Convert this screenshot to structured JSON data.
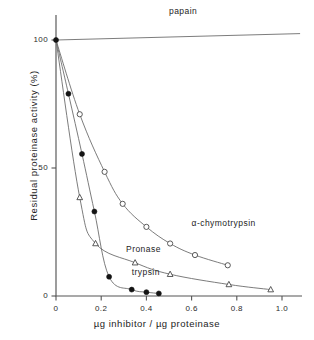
{
  "chart_data": {
    "type": "line",
    "title": "",
    "xlabel": "µg inhibitor / µg proteinase",
    "ylabel": "Residual  proteinase  activity  (%)",
    "xlim": [
      0,
      1.08
    ],
    "ylim": [
      0,
      108
    ],
    "xticks": [
      0,
      0.2,
      0.4,
      0.6,
      0.8,
      1.0
    ],
    "xticklabels": [
      "0",
      "0.2",
      "0.4",
      "0.6",
      "0.8",
      "1.0"
    ],
    "yticks": [
      0,
      50,
      100
    ],
    "yticklabels": [
      "0",
      "50",
      "100"
    ],
    "grid": false,
    "legend_position": "inline-annotations",
    "series": [
      {
        "name": "papain",
        "marker": "none",
        "label_x": 0.5,
        "label_y": 111,
        "x": [
          0.0,
          1.08
        ],
        "y": [
          100,
          102.5
        ]
      },
      {
        "name": "α-chymotrypsin",
        "marker": "open-circle",
        "label_x": 0.6,
        "label_y": 28,
        "x": [
          0.0,
          0.105,
          0.215,
          0.295,
          0.4,
          0.505,
          0.615,
          0.76
        ],
        "y": [
          100,
          71,
          48.5,
          36,
          27,
          20.5,
          16,
          12
        ]
      },
      {
        "name": "Pronase",
        "marker": "open-triangle",
        "label_x": 0.31,
        "label_y": 18,
        "x": [
          0.0,
          0.105,
          0.175,
          0.35,
          0.505,
          0.765,
          0.95
        ],
        "y": [
          100,
          38.5,
          20.5,
          13,
          8.5,
          4.5,
          2.5
        ]
      },
      {
        "name": "trypsin",
        "marker": "filled-circle",
        "label_x": 0.335,
        "label_y": 9,
        "x": [
          0.0,
          0.055,
          0.115,
          0.17,
          0.235,
          0.335,
          0.4,
          0.455
        ],
        "y": [
          100,
          79,
          55.5,
          33,
          7.5,
          2.5,
          1.5,
          1.0
        ]
      }
    ]
  },
  "annotations": {
    "papain": "papain",
    "chymotrypsin": "α-chymotrypsin",
    "pronase": "Pronase",
    "trypsin": "trypsin"
  },
  "axis": {
    "x_title": "µg inhibitor / µg proteinase",
    "y_title": "Residual  proteinase  activity  (%)",
    "x_tick_0": "0",
    "x_tick_1": "0.2",
    "x_tick_2": "0.4",
    "x_tick_3": "0.6",
    "x_tick_4": "0.8",
    "x_tick_5": "1.0",
    "y_tick_0": "0",
    "y_tick_1": "50",
    "y_tick_2": "100"
  },
  "colors": {
    "axis": "#555555",
    "curve": "#6d6d6d",
    "marker_fill": "#141414",
    "marker_open": "#ffffff",
    "text": "#242424",
    "background": "#ffffff"
  }
}
